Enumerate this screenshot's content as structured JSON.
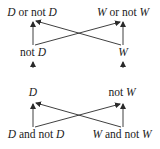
{
  "diagram": {
    "nodes": [
      {
        "id": "d_or_not_d",
        "parts": [
          {
            "t": "D",
            "italic": true
          },
          {
            "t": " or not ",
            "italic": false
          },
          {
            "t": "D",
            "italic": true
          }
        ],
        "x": 32,
        "y": 13
      },
      {
        "id": "w_or_not_w",
        "parts": [
          {
            "t": "W",
            "italic": true
          },
          {
            "t": " or not ",
            "italic": false
          },
          {
            "t": "W",
            "italic": true
          }
        ],
        "x": 123,
        "y": 13
      },
      {
        "id": "not_d",
        "parts": [
          {
            "t": "not ",
            "italic": false
          },
          {
            "t": "D",
            "italic": true
          }
        ],
        "x": 33,
        "y": 53
      },
      {
        "id": "w",
        "parts": [
          {
            "t": "W",
            "italic": true
          }
        ],
        "x": 123,
        "y": 53
      },
      {
        "id": "d",
        "parts": [
          {
            "t": "D",
            "italic": true
          }
        ],
        "x": 33,
        "y": 93
      },
      {
        "id": "not_w",
        "parts": [
          {
            "t": "not ",
            "italic": false
          },
          {
            "t": "W",
            "italic": true
          }
        ],
        "x": 122,
        "y": 93
      },
      {
        "id": "d_and_not_d",
        "parts": [
          {
            "t": "D",
            "italic": true
          },
          {
            "t": " and not ",
            "italic": false
          },
          {
            "t": "D",
            "italic": true
          }
        ],
        "x": 36,
        "y": 135
      },
      {
        "id": "w_and_not_w",
        "parts": [
          {
            "t": "W",
            "italic": true
          },
          {
            "t": " and not ",
            "italic": false
          },
          {
            "t": "W",
            "italic": true
          }
        ],
        "x": 122,
        "y": 135
      }
    ],
    "edges": [
      {
        "from": "not_d",
        "to": "d_or_not_d",
        "x1": 33,
        "y1": 45,
        "x2": 33,
        "y2": 22
      },
      {
        "from": "not_d",
        "to": "w_or_not_w",
        "x1": 35,
        "y1": 45,
        "x2": 120,
        "y2": 22
      },
      {
        "from": "w",
        "to": "w_or_not_w",
        "x1": 123,
        "y1": 45,
        "x2": 123,
        "y2": 22
      },
      {
        "from": "w",
        "to": "d_or_not_d",
        "x1": 121,
        "y1": 45,
        "x2": 36,
        "y2": 21
      },
      {
        "from": "d",
        "to": "not_d",
        "x1": 33,
        "y1": 68,
        "x2": 33,
        "y2": 62
      },
      {
        "from": "not_w",
        "to": "w",
        "x1": 123,
        "y1": 68,
        "x2": 123,
        "y2": 62
      },
      {
        "from": "d_and_not_d",
        "to": "d",
        "x1": 33,
        "y1": 127,
        "x2": 33,
        "y2": 104
      },
      {
        "from": "d_and_not_d",
        "to": "not_w",
        "x1": 35,
        "y1": 127,
        "x2": 120,
        "y2": 104
      },
      {
        "from": "w_and_not_w",
        "to": "not_w",
        "x1": 123,
        "y1": 127,
        "x2": 123,
        "y2": 104
      },
      {
        "from": "w_and_not_w",
        "to": "d",
        "x1": 121,
        "y1": 127,
        "x2": 36,
        "y2": 103
      }
    ],
    "stroke_color": "#2a2a2a"
  }
}
